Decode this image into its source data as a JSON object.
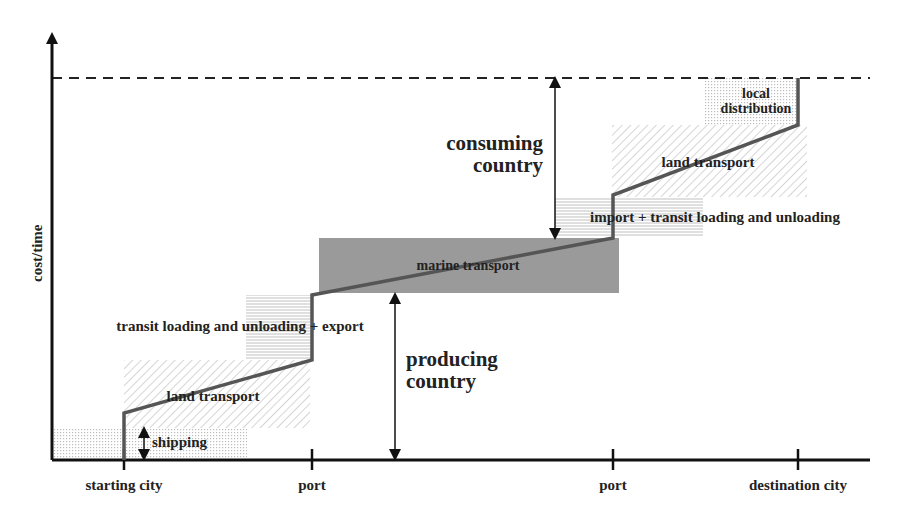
{
  "diagram": {
    "y_axis_label": "cost/time",
    "x_ticks": [
      {
        "label": "starting city",
        "x": 124
      },
      {
        "label": "port",
        "x": 312
      },
      {
        "label": "port",
        "x": 613
      },
      {
        "label": "destination city",
        "x": 798
      }
    ],
    "segments": {
      "shipping": "shipping",
      "land_transport_1": "land transport",
      "transit_export": "transit loading and unloading + export",
      "marine_transport": "marine transport",
      "import_transit": "import + transit loading and unloading",
      "land_transport_2": "land transport",
      "local_distribution_line1": "local",
      "local_distribution_line2": "distribution"
    },
    "annotations": {
      "producing_line1": "producing",
      "producing_line2": "country",
      "consuming_line1": "consuming",
      "consuming_line2": "country"
    },
    "colors": {
      "path": "#555555",
      "axis": "#111111",
      "marine_fill": "#9a9a9a",
      "hatch": "#bbbbbb",
      "dots": "#bdbdbd"
    }
  }
}
